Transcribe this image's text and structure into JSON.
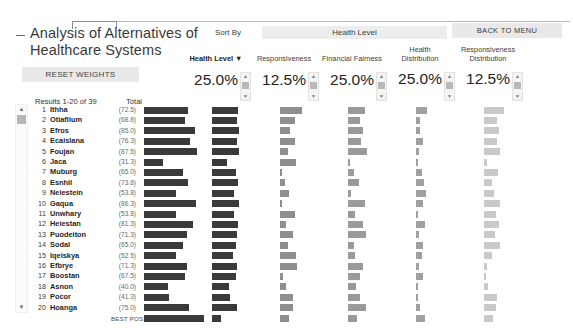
{
  "window": {
    "title": "Analysis of Alternatives of Healthcare Systems"
  },
  "toolbar": {
    "reset_weights_label": "RESET WEIGHTS",
    "back_to_menu_label": "BACK TO MENU",
    "sort_by_label": "Sort By",
    "sort_by_value": "Health Level",
    "collapse_icon": "minus-icon"
  },
  "weights": [
    {
      "label": "Health Level ▼",
      "value": "25.0%",
      "active": true,
      "spinner": "stepper-up-down"
    },
    {
      "label": "Responsiveness",
      "value": "12.5%",
      "active": false,
      "spinner": "stepper-up-down"
    },
    {
      "label": "Financial Fairness",
      "value": "25.0%",
      "active": false,
      "spinner": "stepper-up-down"
    },
    {
      "label": "Health\nDistribution",
      "value": "25.0%",
      "active": false,
      "spinner": "stepper-up-down"
    },
    {
      "label": "Responsiveness\nDistribution",
      "value": "12.5%",
      "active": false,
      "spinner": "stepper-up-down"
    }
  ],
  "results": {
    "header": "Results 1-20 of 39",
    "total_header": "Total",
    "best_possible_label": "BEST POSSIBLE",
    "scroll_up_icon": "chevron-up-icon",
    "scroll_down_icon": "chevron-down-icon"
  },
  "chart_data": {
    "type": "bar",
    "title": "Analysis of Alternatives of Healthcare Systems",
    "xlabel": "",
    "ylabel": "",
    "categories": [
      "Ithha",
      "Otiaflium",
      "Efros",
      "Ecaislana",
      "Foujan",
      "Jaca",
      "Muburg",
      "Esnhil",
      "Neiestein",
      "Gaqua",
      "Unwhary",
      "Heiestan",
      "Puodeiton",
      "Sodal",
      "Iqeiskya",
      "Efbrye",
      "Boostan",
      "Asnon",
      "Pocor",
      "Hoanga"
    ],
    "ranks": [
      1,
      2,
      3,
      4,
      5,
      6,
      7,
      8,
      9,
      10,
      11,
      12,
      13,
      14,
      15,
      16,
      17,
      18,
      19,
      20
    ],
    "total_scores": [
      72.5,
      68.8,
      85.0,
      76.3,
      87.5,
      31.3,
      65.0,
      73.8,
      53.8,
      86.3,
      53.8,
      81.3,
      71.3,
      65.0,
      52.5,
      71.3,
      67.5,
      40.0,
      41.3,
      75.0
    ],
    "series": [
      {
        "name": "Total",
        "values": [
          72.5,
          68.8,
          85.0,
          76.3,
          87.5,
          31.3,
          65.0,
          73.8,
          53.8,
          86.3,
          53.8,
          81.3,
          71.3,
          65.0,
          52.5,
          71.3,
          67.5,
          40.0,
          41.3,
          75.0
        ]
      },
      {
        "name": "Health Level",
        "values": [
          92,
          88,
          95,
          90,
          97,
          55,
          86,
          93,
          78,
          96,
          80,
          94,
          89,
          85,
          76,
          88,
          84,
          62,
          64,
          91
        ]
      },
      {
        "name": "Responsiveness",
        "values": [
          78,
          55,
          36,
          52,
          30,
          58,
          6,
          18,
          32,
          8,
          55,
          20,
          48,
          30,
          56,
          62,
          12,
          22,
          45,
          48
        ]
      },
      {
        "name": "Financial Fairness",
        "values": [
          60,
          44,
          52,
          46,
          68,
          8,
          22,
          40,
          10,
          60,
          26,
          52,
          64,
          20,
          24,
          52,
          44,
          30,
          42,
          66
        ]
      },
      {
        "name": "Health Distribution",
        "values": [
          40,
          16,
          14,
          26,
          10,
          8,
          22,
          30,
          34,
          26,
          8,
          32,
          10,
          24,
          20,
          10,
          26,
          8,
          6,
          14
        ]
      },
      {
        "name": "Responsiveness Distribution",
        "values": [
          70,
          46,
          52,
          48,
          58,
          10,
          50,
          28,
          36,
          56,
          44,
          52,
          40,
          56,
          30,
          12,
          8,
          14,
          46,
          44
        ]
      }
    ],
    "best_possible": {
      "total": 100,
      "values": [
        100,
        100,
        100,
        100,
        100
      ]
    },
    "grid": false,
    "legend": "none"
  }
}
